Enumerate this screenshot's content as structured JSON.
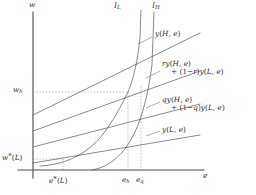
{
  "figure": {
    "kind": "wage-effort-diagram",
    "background": "#ffffff",
    "ink": "#3a3a3a",
    "axis_color": "#555555",
    "dash_color": "#8a8a8a"
  },
  "axes": {
    "y_label": "w",
    "x_label": "e"
  },
  "y_ticks": [
    {
      "id": "w_h",
      "label_html": "w<span class=\"sub\">h</span>",
      "text": "w_h",
      "y": 92
    },
    {
      "id": "w_star_L",
      "label_html": "w<span class=\"sup-star\">*</span><span class=\"up\">(</span>L<span class=\"up\">)</span>",
      "text": "w*(L)",
      "y": 158
    }
  ],
  "x_ticks": [
    {
      "id": "e_star_L",
      "label_html": "e<span class=\"sup-star\">*</span><span class=\"up\">(</span>L<span class=\"up\">)</span>",
      "text": "e*(L)",
      "x": 57
    },
    {
      "id": "e_h",
      "label_html": "e<span class=\"sub\">h</span>",
      "text": "e_h",
      "x": 120
    },
    {
      "id": "e_q",
      "label_html": "e<span class=\"sub\">q</span>",
      "text": "e_q",
      "x": 136
    }
  ],
  "indifference_curves": [
    {
      "id": "I_L",
      "label_html": "I<span class=\"sub\">L</span>",
      "text": "I_L"
    },
    {
      "id": "I_H",
      "label_html": "I<span class=\"sub\">H</span>",
      "text": "I_H"
    }
  ],
  "output_lines": [
    {
      "id": "y_H",
      "line1_html": "y<span class=\"up\">(</span>H, e<span class=\"up\">)</span>",
      "line2_html": "",
      "text": "y(H, e)"
    },
    {
      "id": "ry_mix",
      "line1_html": "ry<span class=\"up\">(</span>H, e<span class=\"up\">)</span>",
      "line2_html": "<span class=\"up\">+ (1&#8722;</span>r<span class=\"up\">)</span>y<span class=\"up\">(</span>L, e<span class=\"up\">)</span>",
      "text": "ry(H, e) + (1-r)y(L, e)"
    },
    {
      "id": "qy_mix",
      "line1_html": "qy<span class=\"up\">(</span>H, e<span class=\"up\">)</span>",
      "line2_html": "<span class=\"up\">+ (1&#8722;</span>q<span class=\"up\">)</span>y<span class=\"up\">(</span>L, e<span class=\"up\">)</span>",
      "text": "qy(H, e) + (1-q)y(L, e)"
    },
    {
      "id": "y_L",
      "line1_html": "y<span class=\"up\">(</span>L, e<span class=\"up\">)</span>",
      "line2_html": "",
      "text": "y(L, e)"
    }
  ],
  "chart_data": {
    "type": "line",
    "title": "",
    "xlabel": "e",
    "ylabel": "w",
    "xlim": [
      0,
      1
    ],
    "ylim": [
      0,
      1
    ],
    "grid": false,
    "legend": "inline-right",
    "series": [
      {
        "name": "y(H, e)",
        "kind": "straight",
        "intercept_px": 115,
        "slope_label": "steepest"
      },
      {
        "name": "ry(H, e) + (1-r)y(L, e)",
        "kind": "straight",
        "intercept_px": 131,
        "slope_label": "high"
      },
      {
        "name": "qy(H, e) + (1-q)y(L, e)",
        "kind": "straight",
        "intercept_px": 147,
        "slope_label": "medium"
      },
      {
        "name": "y(L, e)",
        "kind": "straight",
        "intercept_px": 162,
        "slope_label": "shallow"
      },
      {
        "name": "I_L",
        "kind": "convex-indifference"
      },
      {
        "name": "I_H",
        "kind": "convex-indifference"
      }
    ],
    "reference_lines": [
      {
        "orientation": "horizontal",
        "value_label": "w_h",
        "style": "dashed"
      },
      {
        "orientation": "vertical",
        "value_label": "e_h",
        "style": "dashed"
      },
      {
        "orientation": "vertical",
        "value_label": "e_q",
        "style": "dashed"
      },
      {
        "orientation": "horizontal",
        "value_label": "w*(L)",
        "style": "dashed"
      },
      {
        "orientation": "vertical",
        "value_label": "e*(L)",
        "style": "dashed"
      }
    ],
    "annotations": [
      "Equilibrium at (e_h, w_h) where I_L is tangent to the r-mixture line",
      "Reservation point at (e*(L), w*(L)) on y(L, e)"
    ]
  }
}
